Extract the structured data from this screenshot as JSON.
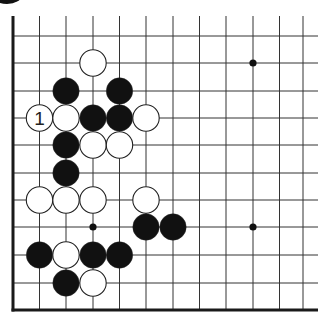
{
  "diagram": {
    "type": "go-board-fragment",
    "colors": {
      "background": "#ffffff",
      "line": "#333333",
      "edge": "#1a1a1a",
      "black_stone": "#111111",
      "white_stone": "#ffffff",
      "stone_outline": "#222222"
    },
    "grid": {
      "columns_x": [
        13,
        39.5,
        66,
        93,
        119.5,
        146,
        173,
        199.5,
        226,
        253,
        279.5,
        303
      ],
      "rows_y": [
        36,
        63,
        91,
        118,
        145,
        173,
        200,
        227,
        255,
        283
      ],
      "top_y": 16,
      "bottom_edge_y": 310,
      "left_edge_x": 13,
      "right_extent_x": 318
    },
    "star_points": [
      {
        "col": 9,
        "row": 1
      },
      {
        "col": 3,
        "row": 7
      },
      {
        "col": 9,
        "row": 7
      }
    ],
    "stones": [
      {
        "col": 3,
        "row": 1,
        "color": "white"
      },
      {
        "col": 2,
        "row": 2,
        "color": "black"
      },
      {
        "col": 4,
        "row": 2,
        "color": "black"
      },
      {
        "col": 1,
        "row": 3,
        "color": "white",
        "label": "1"
      },
      {
        "col": 2,
        "row": 3,
        "color": "white"
      },
      {
        "col": 3,
        "row": 3,
        "color": "black"
      },
      {
        "col": 4,
        "row": 3,
        "color": "black"
      },
      {
        "col": 5,
        "row": 3,
        "color": "white"
      },
      {
        "col": 2,
        "row": 4,
        "color": "black"
      },
      {
        "col": 3,
        "row": 4,
        "color": "white"
      },
      {
        "col": 4,
        "row": 4,
        "color": "white"
      },
      {
        "col": 2,
        "row": 5,
        "color": "black"
      },
      {
        "col": 1,
        "row": 6,
        "color": "white"
      },
      {
        "col": 2,
        "row": 6,
        "color": "white"
      },
      {
        "col": 3,
        "row": 6,
        "color": "white"
      },
      {
        "col": 5,
        "row": 6,
        "color": "white"
      },
      {
        "col": 5,
        "row": 7,
        "color": "black"
      },
      {
        "col": 6,
        "row": 7,
        "color": "black"
      },
      {
        "col": 1,
        "row": 8,
        "color": "black"
      },
      {
        "col": 2,
        "row": 8,
        "color": "white"
      },
      {
        "col": 3,
        "row": 8,
        "color": "black"
      },
      {
        "col": 4,
        "row": 8,
        "color": "black"
      },
      {
        "col": 2,
        "row": 9,
        "color": "black"
      },
      {
        "col": 3,
        "row": 9,
        "color": "white"
      }
    ],
    "stone_radius": 13.2,
    "move_labels": [
      "1"
    ]
  }
}
